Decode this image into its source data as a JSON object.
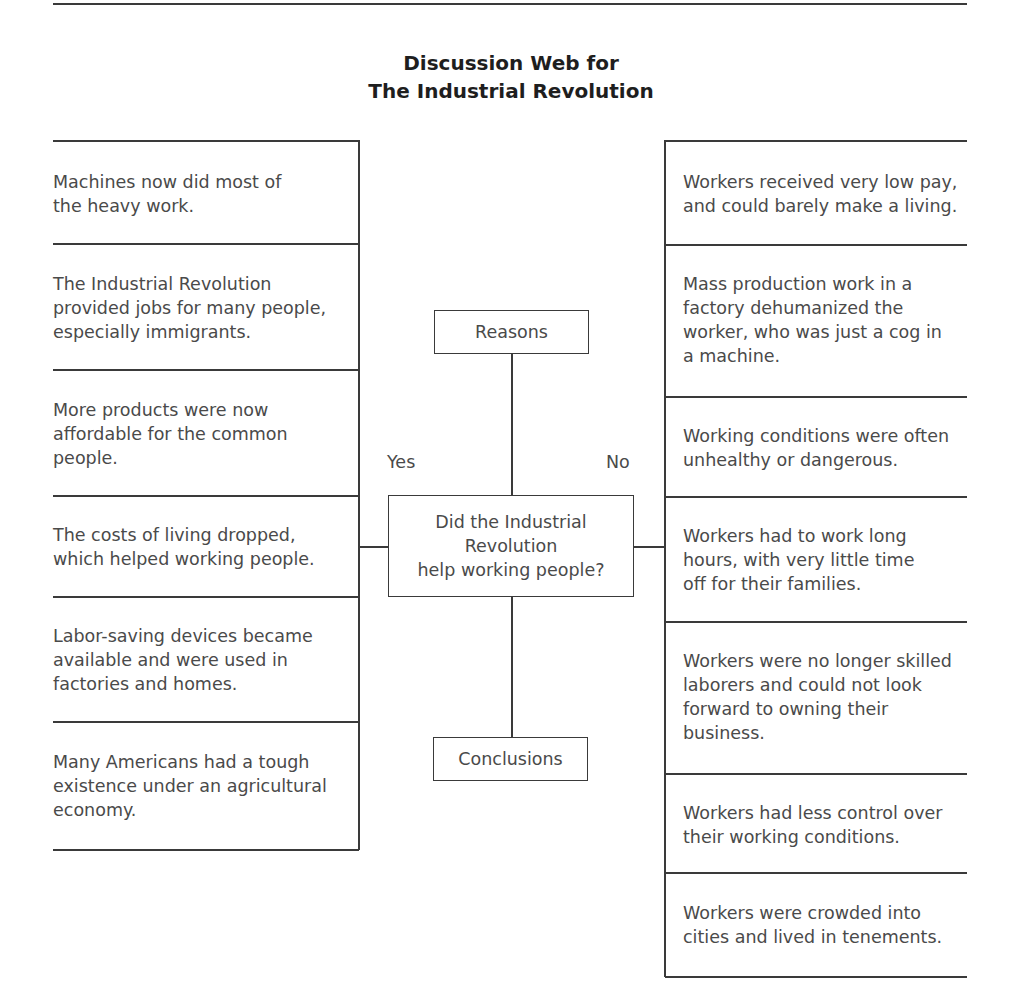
{
  "title": {
    "line1": "Discussion Web for",
    "line2": "The Industrial Revolution"
  },
  "center": {
    "reasons_label": "Reasons",
    "question": "Did the Industrial\nRevolution\nhelp working people?",
    "conclusions_label": "Conclusions",
    "yes_label": "Yes",
    "no_label": "No"
  },
  "yes_column": {
    "items": [
      {
        "text": "Machines now did most of\nthe heavy work."
      },
      {
        "text": "The Industrial Revolution\nprovided jobs for many people,\nespecially immigrants."
      },
      {
        "text": "More products were now\naffordable for the common\npeople."
      },
      {
        "text": "The costs of living dropped,\nwhich helped working people."
      },
      {
        "text": "Labor-saving devices became\navailable and were used in\nfactories and homes."
      },
      {
        "text": "Many Americans had a tough\nexistence under an agricultural\neconomy."
      }
    ]
  },
  "no_column": {
    "items": [
      {
        "text": "Workers received very low pay,\nand could barely make a living."
      },
      {
        "text": "Mass production work in a\nfactory dehumanized the\nworker, who was just a cog in\na machine."
      },
      {
        "text": "Working conditions were often\nunhealthy or dangerous."
      },
      {
        "text": "Workers had to work long\nhours, with very little time\noff for their families."
      },
      {
        "text": "Workers were no longer skilled\nlaborers and could not look\nforward to owning their\nbusiness."
      },
      {
        "text": "Workers had less control over\ntheir working conditions."
      },
      {
        "text": "Workers were crowded into\ncities and lived in tenements."
      }
    ]
  }
}
